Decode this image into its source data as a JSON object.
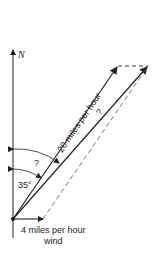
{
  "diagram": {
    "north_label": "N",
    "air_velocity_label": "20 miles per hour",
    "resultant_label": "?",
    "unknown_angle_label": "?",
    "known_angle_label": "35°",
    "wind_label_line1": "4 miles per hour",
    "wind_label_line2": "wind",
    "colors": {
      "line": "#222222",
      "dashed": "#555555",
      "background": "#ffffff"
    }
  }
}
